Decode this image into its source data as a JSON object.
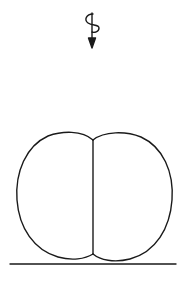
{
  "diagram": {
    "stroke_color": "#1a1a1a",
    "background": "#ffffff",
    "elements": [
      {
        "name": "spiral-arrow",
        "direction": "down"
      },
      {
        "name": "left-lobe"
      },
      {
        "name": "right-lobe"
      },
      {
        "name": "center-divider"
      },
      {
        "name": "ground-line"
      }
    ]
  }
}
